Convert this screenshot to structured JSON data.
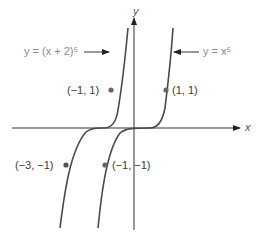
{
  "figure": {
    "title": "",
    "axes": {
      "x_label": "x",
      "y_label": "y"
    },
    "curves": [
      {
        "name": "shifted",
        "label": "y = (x + 2)⁵",
        "color": "#555555"
      },
      {
        "name": "base",
        "label": "y = x⁵",
        "color": "#555555"
      }
    ],
    "points": [
      {
        "label": "(−1, 1)",
        "curve": "shifted"
      },
      {
        "label": "(1, 1)",
        "curve": "base"
      },
      {
        "label": "(−3, −1)",
        "curve": "shifted"
      },
      {
        "label": "(−1, −1)",
        "curve": "base"
      }
    ],
    "colors": {
      "axis": "#222222",
      "curve": "#4a4a4a",
      "point": "#666666",
      "label_gray": "#8a8a8a"
    }
  }
}
